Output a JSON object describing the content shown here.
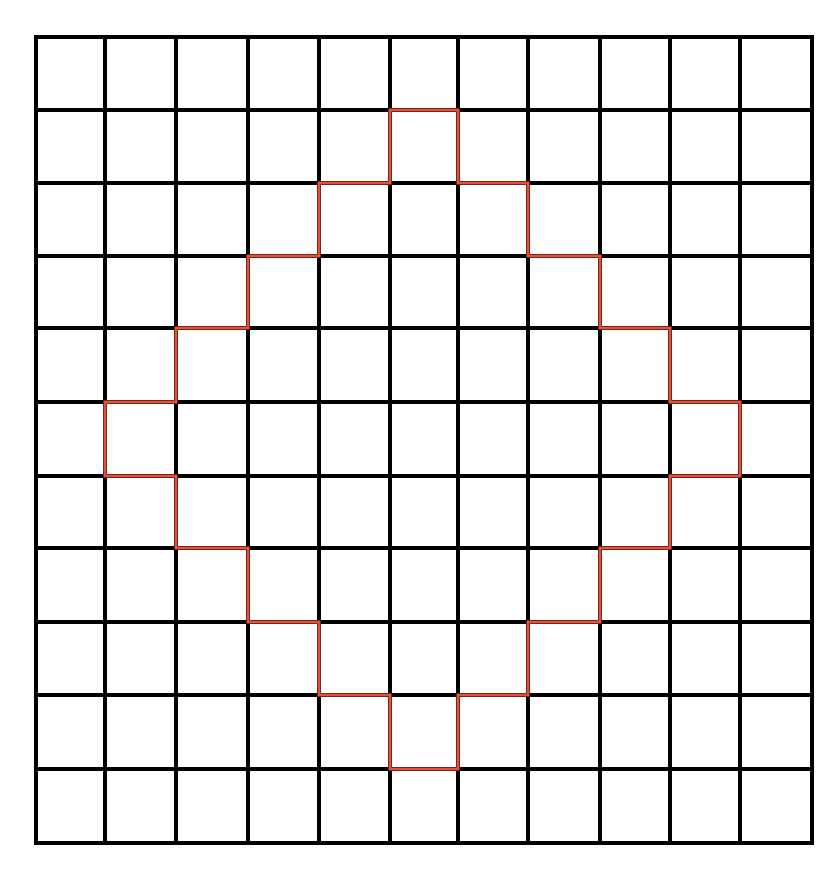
{
  "diagram": {
    "type": "grid-with-outline",
    "columns": 11,
    "rows": 11,
    "x_lines": [
      36,
      105,
      176,
      248,
      319,
      390,
      458,
      528,
      600,
      670,
      740,
      812
    ],
    "y_lines": [
      37,
      110,
      183,
      256,
      328,
      402,
      476,
      548,
      622,
      695,
      769,
      843
    ],
    "grid_color": "#000000",
    "grid_stroke_width": 4,
    "background_color": "#ffffff",
    "outline": {
      "shape": "staircase-diamond",
      "color": "#E8503A",
      "stroke_width": 3,
      "vertices": [
        [
          5,
          1
        ],
        [
          6,
          1
        ],
        [
          6,
          2
        ],
        [
          7,
          2
        ],
        [
          7,
          3
        ],
        [
          8,
          3
        ],
        [
          8,
          4
        ],
        [
          9,
          4
        ],
        [
          9,
          5
        ],
        [
          10,
          5
        ],
        [
          10,
          6
        ],
        [
          9,
          6
        ],
        [
          9,
          7
        ],
        [
          8,
          7
        ],
        [
          8,
          8
        ],
        [
          7,
          8
        ],
        [
          7,
          9
        ],
        [
          6,
          9
        ],
        [
          6,
          10
        ],
        [
          5,
          10
        ],
        [
          5,
          9
        ],
        [
          4,
          9
        ],
        [
          4,
          8
        ],
        [
          3,
          8
        ],
        [
          3,
          7
        ],
        [
          2,
          7
        ],
        [
          2,
          6
        ],
        [
          1,
          6
        ],
        [
          1,
          5
        ],
        [
          2,
          5
        ],
        [
          2,
          4
        ],
        [
          3,
          4
        ],
        [
          3,
          3
        ],
        [
          4,
          3
        ],
        [
          4,
          2
        ],
        [
          5,
          2
        ],
        [
          5,
          1
        ]
      ]
    }
  }
}
